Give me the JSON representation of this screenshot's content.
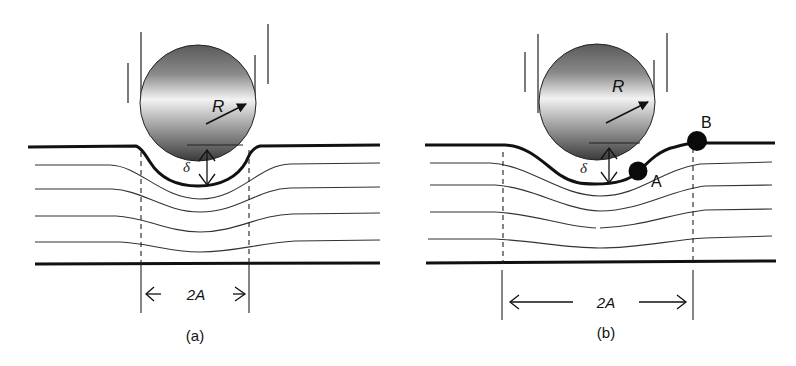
{
  "diagram": {
    "type": "indentation-schematic",
    "background": "#ffffff",
    "stroke_color": "#111111",
    "panels": [
      {
        "id": "a",
        "caption": "(a)",
        "sphere_label": "R",
        "depth_label": "δ",
        "width_label": "2A",
        "points": []
      },
      {
        "id": "b",
        "caption": "(b)",
        "sphere_label": "R",
        "depth_label": "δ",
        "width_label": "2A",
        "points": [
          {
            "name": "A"
          },
          {
            "name": "B"
          }
        ]
      }
    ]
  }
}
